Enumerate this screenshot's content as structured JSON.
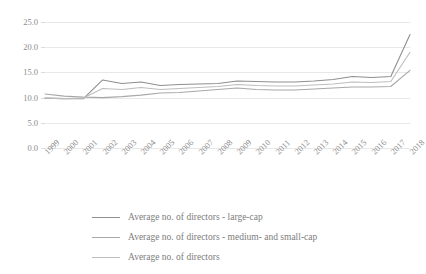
{
  "chart_data": {
    "type": "line",
    "title": "",
    "xlabel": "",
    "ylabel": "",
    "ylim": [
      0.0,
      25.0
    ],
    "ytick_labels": [
      "0.0",
      "5.0",
      "10.0",
      "15.0",
      "20.0",
      "25.0"
    ],
    "ytick_values": [
      0.0,
      5.0,
      10.0,
      15.0,
      20.0,
      25.0
    ],
    "grid": true,
    "legend_position": "bottom-left",
    "categories": [
      "1999",
      "2000",
      "2001",
      "2002",
      "2003",
      "2004",
      "2005",
      "2006",
      "2007",
      "2008",
      "2009",
      "2010",
      "2011",
      "2012",
      "2013",
      "2014",
      "2015",
      "2016",
      "2017",
      "2018"
    ],
    "series": [
      {
        "name": "Average no. of directors - large-cap",
        "color": "#8f8f8f",
        "values": [
          9.9,
          9.8,
          9.8,
          13.5,
          12.8,
          13.1,
          12.4,
          12.6,
          12.7,
          12.8,
          13.3,
          13.2,
          13.1,
          13.1,
          13.3,
          13.6,
          14.2,
          14.0,
          14.2,
          22.5
        ]
      },
      {
        "name": "Average no. of directors - medium- and small-cap",
        "color": "#a8a8a8",
        "values": [
          10.7,
          10.3,
          10.1,
          10.0,
          10.2,
          10.5,
          10.9,
          11.0,
          11.3,
          11.6,
          11.9,
          11.6,
          11.5,
          11.5,
          11.7,
          11.9,
          12.1,
          12.1,
          12.2,
          15.4
        ]
      },
      {
        "name": "Average no. of directors",
        "color": "#bdbdbd",
        "values": [
          9.9,
          9.8,
          9.9,
          11.8,
          11.6,
          12.0,
          11.6,
          11.8,
          12.0,
          12.2,
          12.6,
          12.4,
          12.3,
          12.3,
          12.5,
          12.7,
          13.1,
          13.0,
          13.2,
          19.0
        ]
      }
    ],
    "legend": [
      {
        "label": "Average no. of directors - large-cap",
        "color": "#8f8f8f"
      },
      {
        "label": "Average no. of directors - medium- and small-cap",
        "color": "#a8a8a8"
      },
      {
        "label": "Average no. of directors",
        "color": "#bdbdbd"
      }
    ]
  }
}
